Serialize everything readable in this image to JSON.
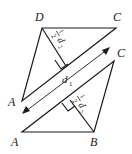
{
  "diagram": {
    "upper_triangle": {
      "vertices": {
        "D": "D",
        "C": "C",
        "A": "A"
      },
      "height_label": {
        "fraction_num": "1",
        "fraction_den": "2",
        "var": "d",
        "sub": "2"
      }
    },
    "lower_triangle": {
      "vertices": {
        "A": "A",
        "B": "B",
        "C": "C"
      },
      "height_label": {
        "fraction_num": "1",
        "fraction_den": "2",
        "var": "d",
        "sub": "2"
      }
    },
    "diagonal": {
      "var": "d",
      "sub": "1"
    },
    "colors": {
      "stroke": "#1a1a1a",
      "background": "#ffffff"
    }
  }
}
